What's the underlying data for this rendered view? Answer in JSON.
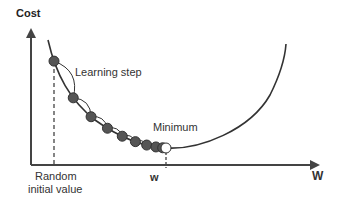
{
  "diagram": {
    "y_axis_label": "Cost",
    "x_axis_label": "W",
    "annotations": {
      "learning_step": "Learning step",
      "minimum": "Minimum",
      "random_initial_line1": "Random",
      "random_initial_line2": "initial value",
      "w_min": "w"
    },
    "steps_count": 10,
    "colors": {
      "line": "#333333",
      "ball_fill": "#555555",
      "ball_open": "#ffffff"
    }
  }
}
